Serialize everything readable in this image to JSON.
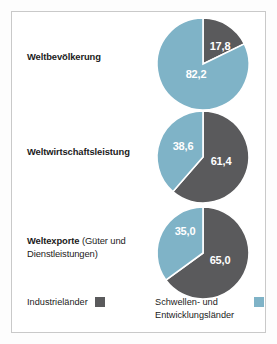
{
  "figure": {
    "background": "#ffffff",
    "frame_color": "#c9c9c9"
  },
  "colors": {
    "industrialised": "#5a5a5c",
    "emerging": "#7fb3c7",
    "slice_separator": "#ffffff",
    "value_label": "#ffffff",
    "text": "#1b1b1b"
  },
  "rows": [
    {
      "label_bold": "Weltbevölkerung",
      "label_rest": ""
    },
    {
      "label_bold": "Weltwirtschaftsleistung",
      "label_rest": ""
    },
    {
      "label_bold": "Weltexporte",
      "label_rest": " (Güter und Dienstleistungen)"
    }
  ],
  "legend": {
    "industrialised_label": "Industrieländer",
    "emerging_label": "Schwellen- und\nEntwicklungsländer"
  },
  "values": {
    "population_industrialised": "17,8",
    "population_emerging": "82,2",
    "economy_industrialised": "61,4",
    "economy_emerging": "38,6",
    "exports_industrialised": "65,0",
    "exports_emerging": "35,0"
  },
  "chart_data": {
    "type": "pie",
    "title": "",
    "legend_position": "bottom",
    "legend": [
      "Industrieländer",
      "Schwellen- und Entwicklungsländer"
    ],
    "series_colors": [
      "#5a5a5c",
      "#7fb3c7"
    ],
    "charts": [
      {
        "name": "Weltbevölkerung",
        "labels": [
          "Industrieländer",
          "Schwellen- und Entwicklungsländer"
        ],
        "values": [
          17.8,
          82.2
        ],
        "data_labels": [
          "17,8",
          "82,2"
        ],
        "unit": "%",
        "start_angle_deg": 0,
        "direction": "clockwise"
      },
      {
        "name": "Weltwirtschaftsleistung",
        "labels": [
          "Industrieländer",
          "Schwellen- und Entwicklungsländer"
        ],
        "values": [
          61.4,
          38.6
        ],
        "data_labels": [
          "61,4",
          "38,6"
        ],
        "unit": "%",
        "start_angle_deg": 0,
        "direction": "clockwise"
      },
      {
        "name": "Weltexporte (Güter und Dienstleistungen)",
        "labels": [
          "Industrieländer",
          "Schwellen- und Entwicklungsländer"
        ],
        "values": [
          65.0,
          35.0
        ],
        "data_labels": [
          "65,0",
          "35,0"
        ],
        "unit": "%",
        "start_angle_deg": 0,
        "direction": "clockwise"
      }
    ]
  }
}
